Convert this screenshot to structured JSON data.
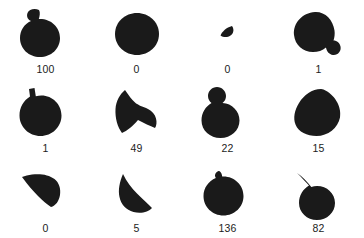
{
  "figure": {
    "type": "shape-mask-grid",
    "columns": 4,
    "rows": 3,
    "background_color": "#ffffff",
    "shape_color": "#1a1a1a",
    "caption_color": "#1c1c1c"
  },
  "cells": [
    {
      "id": "cell-r1c1",
      "label": "100",
      "shape_name": "circle-with-small-bump-upper-left",
      "path": "M30 6 C26 4 20 5 18.5 9 C17 13 19.5 16 22 17 C15 20 11 27 11 34 C11 45 20 53 31 53 C42 53 51 45 51 34 C51 23 42 15 31 15 C30.6 15 30.2 15 29.8 15 C30.6 12.5 31.5 8.5 30 6 Z"
    },
    {
      "id": "cell-r1c2",
      "label": "0",
      "shape_name": "round-blob",
      "path": "M37 9 C25 9 15 18 15 30 C15 42 25 51 37 51 C49 51 59 42 59 30 C59 18 49 9 37 9 Z"
    },
    {
      "id": "cell-r1c3",
      "label": "0",
      "shape_name": "tiny-crescent-sliver",
      "path": "M41 22 C35.5 23.5 31 27.5 29.5 31.5 C32.5 33.5 36.5 33.5 39.5 31.5 C42.5 29.5 43.5 25.5 41 22 Z"
    },
    {
      "id": "cell-r1c4",
      "label": "1",
      "shape_name": "blob-with-lower-right-lobe",
      "path": "M33 8 C20 9 11 19 12 31 C13 41 21 48 31 48 C36 48 40.5 46.5 44 43.5 C44.5 47 47 50.5 51 51 C56 51.5 59.5 47 58.5 42.5 C57.8 39 55 36.5 51.5 36.5 C52.5 33.5 53 30 52.5 26.5 C51 15.5 43 7.5 33 8 Z"
    },
    {
      "id": "cell-r2c1",
      "label": "1",
      "shape_name": "circle-with-square-knob-top-left",
      "path": "M25.5 5 L20 6 L21 13.5 C14.5 17.5 10.5 24.5 10.5 32.5 C10.5 44 20 53 31.5 53 C43 53 52.5 44 52.5 32.5 C52.5 21.5 43.5 12.5 32.5 12.5 C30.5 12.5 28.5 12.8 26.8 13.3 Z"
    },
    {
      "id": "cell-r2c2",
      "label": "49",
      "shape_name": "arrowhead-heart-blob",
      "path": "M25 7 C20 11 16 18 15.5 26 C15 35 17.5 44 22 50 C27 48 33 43 38 37 C44 40 50 43 55 45 C56.5 43 57 39 56 35.5 C55 31.5 52 28 48 26 C43 23.5 37 22.5 32.5 17 C29.5 13.5 27 10 25 7 Z"
    },
    {
      "id": "cell-r2c3",
      "label": "22",
      "shape_name": "circle-with-round-knob-top-left",
      "path": "M26 4 C21 4 17 8 17 13 C17 16 18.5 18.5 20.5 20 C14.5 23.5 10.5 30 10.5 37.5 C10.5 47.5 19 55 29.5 55 C40 55 48.5 47.5 48.5 37.5 C48.5 28 41 20.5 31.5 20 C33.8 18.3 35 15.8 35 13 C35 8 31 4 26 4 Z"
    },
    {
      "id": "cell-r2c4",
      "label": "15",
      "shape_name": "pear-teardrop",
      "path": "M39 6 C30 6 22 12 17 20 C12.5 27 11 35 13.5 41.5 C16.5 49 25 53 34.5 53 C46 53 56 45 58 34.5 C60 23 52 11 41.5 6.5 C40.8 6.2 40 6 39 6 Z"
    },
    {
      "id": "cell-r3c1",
      "label": "0",
      "shape_name": "curved-wedge-pointing-left",
      "path": "M13 14 C19 22 24 28 29 33 C33.5 37.5 38 41.5 42 44 C46.5 43 50 38 51 32 C52 25.5 50 19.5 45.5 16 C40 11.5 31 10.5 23 11.5 C19.5 12 16 12.8 13 14 Z"
    },
    {
      "id": "cell-r3c2",
      "label": "5",
      "shape_name": "half-moon-wedge",
      "path": "M23 11 C19.5 19 18 27 19.5 34 C21 41.5 26 47 33.5 49 C41 51 48.5 49 52 45 C48 41 42.5 36 37 30.5 C31.5 25 26.5 18.5 23 11 Z"
    },
    {
      "id": "cell-r3c3",
      "label": "136",
      "shape_name": "circle-with-notch-upper-left",
      "path": "M27.5 8 C25.5 8.5 24 10.5 24 12.5 C24 13.5 24.3 14.3 24.8 15 C17.5 18 12.5 25 12.5 33 C12.5 44 21.5 52.5 32.5 52.5 C43.5 52.5 52.5 44 52.5 33 C52.5 22 43.5 13.5 32.5 13.5 C32 13.5 31.6 13.5 31.2 13.6 C31 10.5 29.5 8 27.5 8 Z"
    },
    {
      "id": "cell-r3c4",
      "label": "82",
      "shape_name": "circle-with-curved-stem-upper-left",
      "path": "M15 10 C19.5 14.5 24 19 27 22.5 C21 26 17 32.5 17 40 C17 49.5 25 57 35 57 C45 57 53 49.5 53 40 C53 30.5 45 23 35 23 C33 23 31 23.3 29.3 23.9 C25.5 19.5 20.5 13.5 15 10 Z"
    }
  ]
}
